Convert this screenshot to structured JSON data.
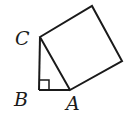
{
  "diagram": {
    "labels": {
      "C": "C",
      "B": "B",
      "A": "A"
    },
    "points": {
      "C": [
        40,
        37
      ],
      "B": [
        39,
        90
      ],
      "A": [
        70,
        90
      ],
      "D": [
        122,
        61
      ],
      "E": [
        92,
        6
      ]
    },
    "right_angle_at": "B",
    "stroke_color": "#1a1a1a"
  }
}
